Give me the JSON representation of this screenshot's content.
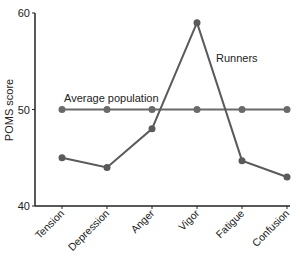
{
  "chart_data": {
    "type": "line",
    "title": "",
    "xlabel": "",
    "ylabel": "POMS score",
    "ylim": [
      40,
      60
    ],
    "yticks": [
      40,
      50,
      60
    ],
    "grid": false,
    "legend": "inline annotations",
    "categories": [
      "Tension",
      "Depression",
      "Anger",
      "Vigor",
      "Fatigue",
      "Confusion"
    ],
    "series": [
      {
        "name": "Runners",
        "values": [
          45,
          44,
          48,
          59,
          44.7,
          43
        ],
        "color": "#5a5a5a"
      },
      {
        "name": "Average population",
        "values": [
          50,
          50,
          50,
          50,
          50,
          50
        ],
        "color": "#6a6a6a"
      }
    ],
    "annotations": [
      {
        "text": "Average population",
        "near": "Tension-Anger, above 50 line"
      },
      {
        "text": "Runners",
        "near": "right of Vigor peak"
      }
    ]
  },
  "labels": {
    "ylabel": "POMS score",
    "ytick_40": "40",
    "ytick_50": "50",
    "ytick_60": "60",
    "avg_annotation": "Average population",
    "runners_annotation": "Runners"
  }
}
